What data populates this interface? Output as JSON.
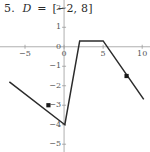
{
  "header": {
    "number": "5.",
    "variable": "D",
    "equals": "=",
    "domain": "[−2, 8]",
    "full": "5.  D = [−2, 8]"
  },
  "chart_data": {
    "type": "line",
    "title": "",
    "subtitle": "",
    "xlabel": "",
    "ylabel": "",
    "xlim": [
      -8.2,
      11.0
    ],
    "ylim": [
      -5.4,
      2.4
    ],
    "grid": false,
    "legend": false,
    "legend_position": "none",
    "x_ticks": [
      -5,
      0,
      5,
      10
    ],
    "x_tick_labels": [
      "−5",
      "0",
      "5",
      "10"
    ],
    "y_ticks": [
      2,
      1,
      0,
      -1,
      -2,
      -3,
      -4,
      -5
    ],
    "y_tick_labels": [
      "2",
      "1",
      "0",
      "−1",
      "−2",
      "−3",
      "−4",
      "−5"
    ],
    "series": [
      {
        "name": "f",
        "x": [
          -7.0,
          0.1,
          2.0,
          5.0,
          10.2
        ],
        "y": [
          -1.8,
          -4.0,
          0.3,
          0.3,
          -2.7
        ]
      }
    ],
    "markers": [
      {
        "name": "left-endpoint",
        "x": -2.0,
        "y": -3.0,
        "shape": "filled-square"
      },
      {
        "name": "right-endpoint",
        "x": 8.0,
        "y": -1.5,
        "shape": "filled-square"
      }
    ],
    "colors": {
      "curve": "#2b2b2b",
      "axis": "#9a9a9a",
      "tick_label": "#555555",
      "marker": "#1a1a1a",
      "background": "#ffffff"
    }
  }
}
